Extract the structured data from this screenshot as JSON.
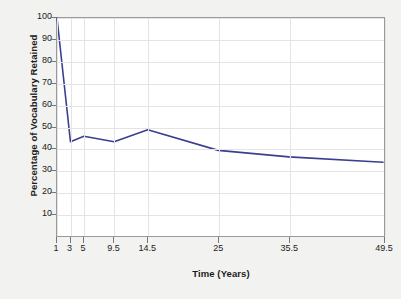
{
  "chart_data": {
    "type": "line",
    "title": "",
    "xlabel": "Time (Years)",
    "ylabel": "Percentage of Vocabulary Retained",
    "x": [
      1,
      3,
      5,
      9.5,
      14.5,
      25,
      35.5,
      49.5
    ],
    "values": [
      100,
      43,
      45.5,
      43,
      48.5,
      39,
      36,
      33.5
    ],
    "series": [
      {
        "name": "Vocabulary retained",
        "x": [
          1,
          3,
          5,
          9.5,
          14.5,
          25,
          35.5,
          49.5
        ],
        "values": [
          100,
          43,
          45.5,
          43,
          48.5,
          39,
          36,
          33.5
        ]
      }
    ],
    "xtick_labels": [
      "1",
      "3",
      "5",
      "9.5",
      "14.5",
      "25",
      "35.5",
      "49.5"
    ],
    "xtick_values": [
      1,
      3,
      5,
      9.5,
      14.5,
      25,
      35.5,
      49.5
    ],
    "ytick_labels": [
      "10",
      "20",
      "30",
      "40",
      "50",
      "60",
      "70",
      "80",
      "90",
      "100"
    ],
    "ytick_values": [
      10,
      20,
      30,
      40,
      50,
      60,
      70,
      80,
      90,
      100
    ],
    "xlim": [
      1,
      49.5
    ],
    "ylim": [
      0,
      100
    ],
    "grid": true,
    "legend": "none",
    "line_color": "#3b3f8f",
    "grid_color": "#e4e4e4",
    "axis_color": "#9a9a9a",
    "plot_background": "#ffffff",
    "page_background": "#f2f2f0"
  }
}
